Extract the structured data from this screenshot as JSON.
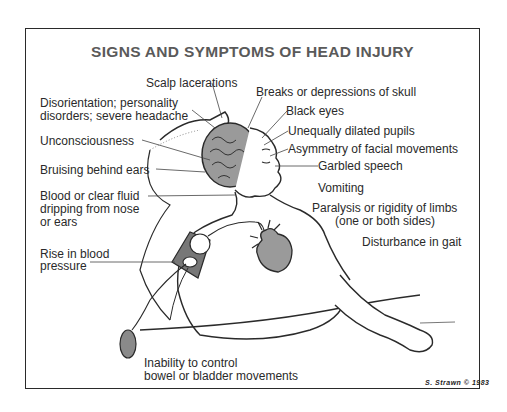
{
  "diagram": {
    "title": "SIGNS AND SYMPTOMS OF HEAD INJURY",
    "signature": "S. Strawn © 1983",
    "labels": {
      "scalp": "Scalp lacerations",
      "skull": "Breaks or depressions of skull",
      "disorientation_1": "Disorientation; personality",
      "disorientation_2": "disorders; severe headache",
      "black_eyes": "Black eyes",
      "pupils": "Unequally dilated pupils",
      "asymmetry": "Asymmetry of facial movements",
      "unconscious": "Unconsciousness",
      "garbled": "Garbled speech",
      "bruising": "Bruising behind ears",
      "vomiting": "Vomiting",
      "blood_1": "Blood or clear fluid",
      "blood_2": "dripping from nose",
      "blood_3": "or ears",
      "paralysis_1": "Paralysis or rigidity of limbs",
      "paralysis_2": "(one or both sides)",
      "gait": "Disturbance in gait",
      "bp_1": "Rise in blood",
      "bp_2": "pressure",
      "bowel_1": "Inability to control",
      "bowel_2": "bowel or bladder movements"
    },
    "colors": {
      "title": "#5a5a5a",
      "ink": "#2a2a2a",
      "shade": "#8a8a8a",
      "heart": "#9a9a9a",
      "cuff": "#777777"
    }
  }
}
